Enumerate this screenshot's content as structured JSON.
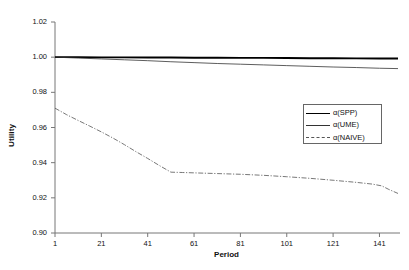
{
  "chart_data": {
    "type": "line",
    "title": "",
    "xlabel": "Period",
    "ylabel": "Utility",
    "xlim": [
      1,
      149
    ],
    "ylim": [
      0.9,
      1.02
    ],
    "grid": false,
    "legend_position": "right-upper-inside",
    "xticks": [
      1,
      21,
      41,
      61,
      81,
      101,
      121,
      141
    ],
    "xtick_labels": [
      "1",
      "21",
      "41",
      "61",
      "81",
      "101",
      "121",
      "141"
    ],
    "yticks": [
      0.9,
      0.92,
      0.94,
      0.96,
      0.98,
      1.0,
      1.02
    ],
    "ytick_labels": [
      "0.90",
      "0.92",
      "0.94",
      "0.96",
      "0.98",
      "1.00",
      "1.02"
    ],
    "series": [
      {
        "name": "α(SPP)",
        "style": "solid-thick",
        "color": "#000000",
        "x": [
          1,
          11,
          21,
          31,
          41,
          51,
          61,
          71,
          81,
          91,
          101,
          111,
          121,
          131,
          141,
          149
        ],
        "values": [
          1.0,
          1.0,
          0.9999,
          0.9999,
          0.9998,
          0.9998,
          0.9997,
          0.9997,
          0.9996,
          0.9996,
          0.9995,
          0.9994,
          0.9994,
          0.9993,
          0.9992,
          0.9992
        ]
      },
      {
        "name": "α(UME)",
        "style": "solid-thin",
        "color": "#333333",
        "x": [
          1,
          11,
          21,
          31,
          41,
          51,
          61,
          71,
          81,
          91,
          101,
          111,
          121,
          131,
          141,
          149
        ],
        "values": [
          1.0,
          0.9995,
          0.999,
          0.9985,
          0.998,
          0.9974,
          0.9969,
          0.9964,
          0.996,
          0.9956,
          0.9952,
          0.9948,
          0.9944,
          0.9941,
          0.9937,
          0.9935
        ]
      },
      {
        "name": "α(NAIVE)",
        "style": "dash-dot",
        "color": "#555555",
        "x": [
          1,
          6,
          11,
          16,
          21,
          26,
          31,
          36,
          41,
          46,
          51,
          56,
          61,
          71,
          81,
          91,
          101,
          111,
          121,
          131,
          138,
          142,
          145,
          149
        ],
        "values": [
          0.971,
          0.9673,
          0.964,
          0.9608,
          0.9575,
          0.954,
          0.9502,
          0.9462,
          0.9424,
          0.9384,
          0.9346,
          0.9344,
          0.9342,
          0.9338,
          0.9334,
          0.9328,
          0.932,
          0.9311,
          0.93,
          0.9288,
          0.9278,
          0.9268,
          0.9248,
          0.9225
        ]
      }
    ]
  },
  "axes": {
    "ylabel": "Utility",
    "xlabel": "Period"
  },
  "legend": {
    "entries": [
      {
        "label": "α(SPP)"
      },
      {
        "label": "α(UME)"
      },
      {
        "label": "α(NAIVE)"
      }
    ]
  }
}
